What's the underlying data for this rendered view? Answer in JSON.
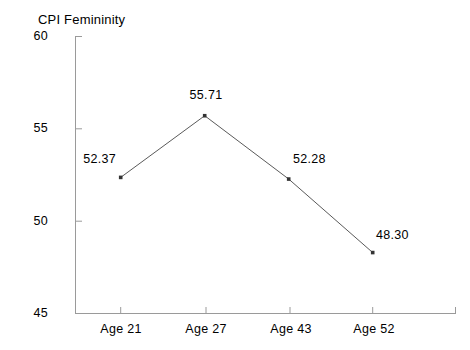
{
  "chart_data": {
    "type": "line",
    "title": "CPI Femininity",
    "xlabel": "",
    "ylabel": "",
    "categories": [
      "Age 21",
      "Age 27",
      "Age 43",
      "Age 52"
    ],
    "values": [
      52.37,
      55.71,
      52.28,
      48.3
    ],
    "point_labels": [
      "52.37",
      "55.71",
      "52.28",
      "48.30"
    ],
    "ylim": [
      45,
      60
    ],
    "yticks": [
      45,
      50,
      55,
      60
    ],
    "ytick_labels": [
      "45",
      "50",
      "55",
      "60"
    ],
    "grid": false,
    "legend": null,
    "marker": "square",
    "line_color": "#555555",
    "marker_color": "#333333",
    "axis_color": "#999999",
    "text_color": "#000000"
  },
  "axes": {
    "spines": [
      "left",
      "bottom"
    ],
    "tick_direction": "in"
  }
}
